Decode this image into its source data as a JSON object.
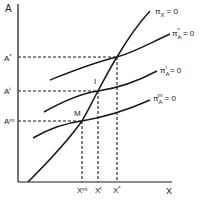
{
  "diagram": {
    "axes": {
      "y_label": "A",
      "x_label": "X"
    },
    "y_ticks": [
      {
        "label": "A*",
        "base": "A",
        "sup": "*"
      },
      {
        "label": "A'",
        "base": "A",
        "sup": "i"
      },
      {
        "label": "A=",
        "base": "A",
        "sup": "m"
      }
    ],
    "x_ticks": [
      {
        "label": "X=",
        "base": "X",
        "sup": "m"
      },
      {
        "label": "X'",
        "base": "X",
        "sup": "i"
      },
      {
        "label": "X*",
        "base": "X",
        "sup": "*"
      }
    ],
    "points": [
      {
        "label": "I"
      },
      {
        "label": "M"
      }
    ],
    "curves": [
      {
        "name": "pi_X",
        "base": "π",
        "sub": "X",
        "sup": "",
        "eq": "= 0"
      },
      {
        "name": "pi_A_star",
        "base": "π",
        "sub": "A",
        "sup": "*",
        "eq": "= 0"
      },
      {
        "name": "pi_A_i",
        "base": "π",
        "sub": "A",
        "sup": "i",
        "eq": "= 0"
      },
      {
        "name": "pi_A_m",
        "base": "π",
        "sub": "A",
        "sup": "m",
        "eq": "= 0"
      }
    ],
    "colors": {
      "line": "#1a1a1a",
      "background": "#ffffff"
    }
  }
}
